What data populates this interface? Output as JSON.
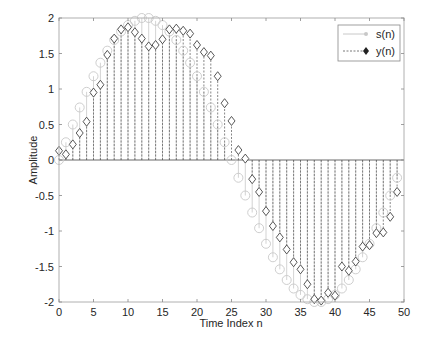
{
  "chart_data": {
    "type": "stem",
    "title": "",
    "xlabel": "Time Index n",
    "ylabel": "Amplitude",
    "xlim": [
      0,
      50
    ],
    "ylim": [
      -2,
      2
    ],
    "xticks": [
      0,
      5,
      10,
      15,
      20,
      25,
      30,
      35,
      40,
      45,
      50
    ],
    "yticks": [
      -2,
      -1.5,
      -1,
      -0.5,
      0,
      0.5,
      1,
      1.5,
      2
    ],
    "xtick_labels": [
      "0",
      "5",
      "10",
      "15",
      "20",
      "25",
      "30",
      "35",
      "40",
      "45",
      "50"
    ],
    "ytick_labels": [
      "-2",
      "-1.5",
      "-1",
      "-0.5",
      "0",
      "0.5",
      "1",
      "1.5",
      "2"
    ],
    "grid": false,
    "legend_position": "upper right",
    "x": [
      0,
      1,
      2,
      3,
      4,
      5,
      6,
      7,
      8,
      9,
      10,
      11,
      12,
      13,
      14,
      15,
      16,
      17,
      18,
      19,
      20,
      21,
      22,
      23,
      24,
      25,
      26,
      27,
      28,
      29,
      30,
      31,
      32,
      33,
      34,
      35,
      36,
      37,
      38,
      39,
      40,
      41,
      42,
      43,
      44,
      45,
      46,
      47,
      48,
      49
    ],
    "series": [
      {
        "name": "s(n)",
        "marker": "circle",
        "line_style": "solid",
        "color": "#c8c8c8",
        "values": [
          0.0,
          0.25,
          0.5,
          0.74,
          0.96,
          1.18,
          1.37,
          1.54,
          1.69,
          1.81,
          1.9,
          1.96,
          2.0,
          2.0,
          1.96,
          1.9,
          1.81,
          1.69,
          1.54,
          1.37,
          1.18,
          0.96,
          0.74,
          0.5,
          0.25,
          0.0,
          -0.25,
          -0.5,
          -0.74,
          -0.96,
          -1.18,
          -1.37,
          -1.54,
          -1.69,
          -1.81,
          -1.9,
          -1.96,
          -2.0,
          -2.0,
          -1.96,
          -1.9,
          -1.81,
          -1.69,
          -1.54,
          -1.37,
          -1.18,
          -0.96,
          -0.74,
          -0.5,
          -0.25
        ]
      },
      {
        "name": "y(n)",
        "marker": "diamond",
        "line_style": "dashed",
        "color": "#555555",
        "values": [
          0.13,
          0.08,
          0.22,
          0.38,
          0.54,
          0.95,
          1.06,
          1.48,
          1.71,
          1.84,
          1.87,
          1.8,
          1.71,
          1.6,
          1.62,
          1.7,
          1.84,
          1.85,
          1.82,
          1.78,
          1.62,
          1.52,
          1.47,
          1.18,
          0.8,
          0.55,
          0.14,
          0.02,
          -0.27,
          -0.45,
          -0.72,
          -0.93,
          -1.09,
          -1.26,
          -1.44,
          -1.54,
          -1.75,
          -1.96,
          -1.98,
          -1.87,
          -1.91,
          -1.5,
          -1.56,
          -1.43,
          -1.22,
          -1.2,
          -1.03,
          -1.02,
          -0.8,
          -0.45
        ]
      }
    ]
  },
  "legend": {
    "items": [
      {
        "label": "s(n)"
      },
      {
        "label": "y(n)"
      }
    ]
  },
  "axes": {
    "xlabel": "Time Index n",
    "ylabel": "Amplitude"
  }
}
